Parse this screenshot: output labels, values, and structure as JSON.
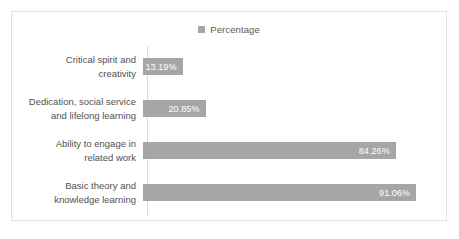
{
  "chart_data": {
    "type": "bar",
    "orientation": "horizontal",
    "title": "",
    "xlabel": "",
    "ylabel": "",
    "grid": false,
    "legend_position": "top-center",
    "legend": [
      "Percentage"
    ],
    "series": [
      {
        "name": "Percentage",
        "color": "#a6a6a6",
        "values": [
          13.19,
          20.85,
          84.26,
          91.06
        ]
      }
    ],
    "categories": [
      "Critical spirit and creativity",
      "Dedication, social service and lifelong learning",
      "Ability to engage in related work",
      "Basic theory and knowledge learning"
    ],
    "data_labels": [
      "13.19%",
      "20.85%",
      "84.26%",
      "91.06%"
    ],
    "xlim": [
      0,
      100
    ],
    "value_suffix": "%"
  },
  "legend": {
    "series_label": "Percentage",
    "swatch_color": "#a6a6a6"
  },
  "categories": [
    {
      "line1": "Critical spirit and",
      "line2": "creativity",
      "value_label": "13.19%"
    },
    {
      "line1": "Dedication, social service",
      "line2": "and lifelong learning",
      "value_label": "20.85%"
    },
    {
      "line1": "Ability to engage in",
      "line2": "related work",
      "value_label": "84.26%"
    },
    {
      "line1": "Basic theory and",
      "line2": "knowledge learning",
      "value_label": "91.06%"
    }
  ],
  "colors": {
    "bar": "#a6a6a6",
    "label_text": "#515151",
    "value_text": "#ffffff",
    "axis_line": "#d9d9d9",
    "frame_border": "#e2e2e2",
    "background": "#ffffff"
  }
}
